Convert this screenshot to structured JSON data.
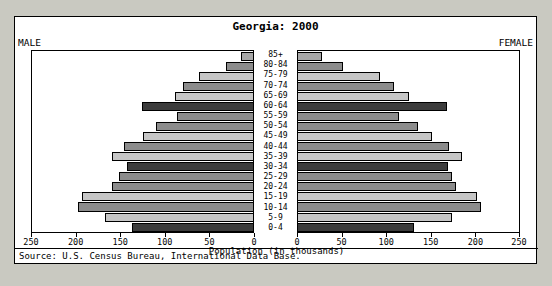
{
  "chart_data": {
    "type": "bar",
    "subtype": "population-pyramid",
    "title": "Georgia: 2000",
    "xlabel": "Population (in thousands)",
    "ylabel": "",
    "left_header": "MALE",
    "right_header": "FEMALE",
    "source": "Source: U.S. Census Bureau, International Data Base.",
    "grid": false,
    "legend": "none",
    "axis_max": 250,
    "xticks": [
      250,
      200,
      150,
      100,
      50,
      0,
      0,
      50,
      100,
      150,
      200,
      250
    ],
    "categories": [
      "85+",
      "80-84",
      "75-79",
      "70-74",
      "65-69",
      "60-64",
      "55-59",
      "50-54",
      "45-49",
      "40-44",
      "35-39",
      "30-34",
      "25-29",
      "20-24",
      "15-19",
      "10-14",
      "5-9",
      "0-4"
    ],
    "series": [
      {
        "name": "MALE",
        "side": "left",
        "values": [
          14,
          31,
          61,
          79,
          88,
          126,
          86,
          110,
          124,
          146,
          160,
          143,
          152,
          160,
          193,
          198,
          168,
          137
        ]
      },
      {
        "name": "FEMALE",
        "side": "right",
        "values": [
          27,
          51,
          93,
          109,
          125,
          169,
          114,
          136,
          152,
          171,
          186,
          170,
          174,
          179,
          203,
          207,
          174,
          131
        ]
      }
    ],
    "bar_shades": [
      "#a8a8a8",
      "#8c8c8c",
      "#c6c6c6",
      "#8c8c8c",
      "#c6c6c6",
      "#3c3c3c",
      "#8c8c8c",
      "#8c8c8c",
      "#c6c6c6",
      "#8c8c8c",
      "#c6c6c6",
      "#3c3c3c",
      "#8c8c8c",
      "#8c8c8c",
      "#c6c6c6",
      "#8c8c8c",
      "#c6c6c6",
      "#3c3c3c"
    ]
  },
  "colors": {
    "page_background": "#c9c9c1",
    "panel_background": "#ffffff",
    "frame": "#000000",
    "shade_light": "#c6c6c6",
    "shade_medium": "#8c8c8c",
    "shade_dark": "#3c3c3c"
  }
}
